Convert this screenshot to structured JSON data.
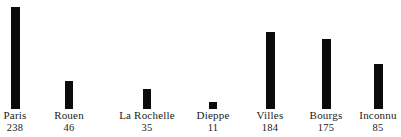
{
  "chart_data": {
    "type": "bar",
    "title": "",
    "subtitle": "",
    "xlabel": "",
    "ylabel": "",
    "grid": false,
    "legend": "none",
    "orientation": "vertical",
    "bar_color": "#0b0b0b",
    "background_color": "#ffffff",
    "ylim": [
      0,
      255
    ],
    "categories": [
      "Paris",
      "Rouen",
      "La Rochelle",
      "Dieppe",
      "Villes",
      "Bourgs",
      "Inconnu"
    ],
    "values": [
      238,
      46,
      35,
      11,
      184,
      175,
      85
    ],
    "value_labels": [
      "238",
      "46",
      "35",
      "11",
      "184",
      "175",
      "85"
    ],
    "series": [
      {
        "name": "",
        "values": [
          238,
          46,
          35,
          11,
          184,
          175,
          85
        ]
      }
    ],
    "points": [
      {
        "category": "Paris",
        "value": 238,
        "label": "238",
        "center_x": 15,
        "bar_width": 9,
        "bar_height": 102
      },
      {
        "category": "Rouen",
        "value": 46,
        "label": "46",
        "center_x": 69,
        "bar_width": 8,
        "bar_height": 28
      },
      {
        "category": "La Rochelle",
        "value": 35,
        "label": "35",
        "center_x": 147,
        "bar_width": 8,
        "bar_height": 20
      },
      {
        "category": "Dieppe",
        "value": 11,
        "label": "11",
        "center_x": 213,
        "bar_width": 8,
        "bar_height": 7
      },
      {
        "category": "Villes",
        "value": 184,
        "label": "184",
        "center_x": 270,
        "bar_width": 9,
        "bar_height": 77
      },
      {
        "category": "Bourgs",
        "value": 175,
        "label": "175",
        "center_x": 326,
        "bar_width": 9,
        "bar_height": 70
      },
      {
        "category": "Inconnu",
        "value": 85,
        "label": "85",
        "center_x": 378,
        "bar_width": 9,
        "bar_height": 45
      }
    ]
  }
}
